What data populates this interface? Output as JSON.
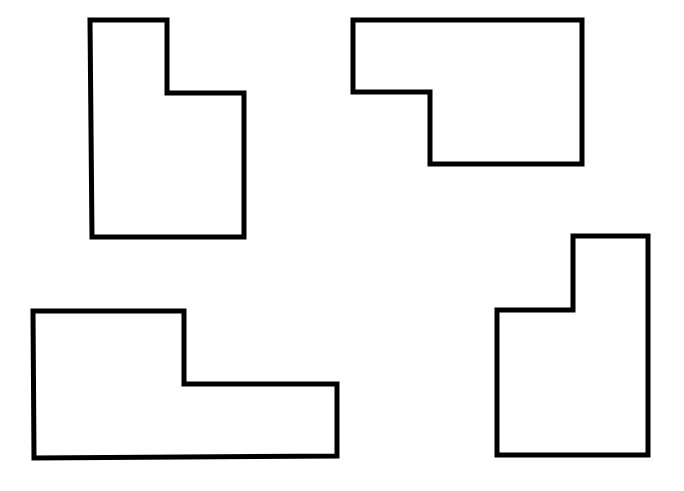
{
  "diagram": {
    "background": "#ffffff",
    "stroke_color": "#000000",
    "stroke_width": 5,
    "shapes": [
      {
        "name": "l-shape-top-left",
        "points": "90,20 167,20 167,93 244,93 244,237 92,237"
      },
      {
        "name": "l-shape-top-right",
        "points": "353,20 582,20 582,164 430,164 430,92 353,92"
      },
      {
        "name": "l-shape-bottom-left",
        "points": "33,311 184,311 184,384 337,384 337,456 34,458"
      },
      {
        "name": "l-shape-bottom-right",
        "points": "573,236 648,236 648,455 497,455 497,310 573,310"
      }
    ]
  }
}
